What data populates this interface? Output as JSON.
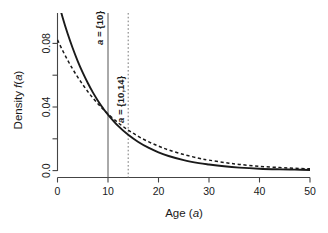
{
  "chart_data": {
    "type": "line",
    "title": "",
    "subtitle": "",
    "xlabel": "Age (a)",
    "xlabel_plain": "Age",
    "xlabel_variable": "a",
    "ylabel": "Density f(a)",
    "ylabel_plain": "Density",
    "ylabel_function": "f",
    "ylabel_variable": "a",
    "xlim": [
      0,
      50
    ],
    "ylim": [
      0,
      0.095
    ],
    "grid": false,
    "legend": "none",
    "xticks": [
      0,
      10,
      20,
      30,
      40,
      50
    ],
    "xtick_labels": [
      "0",
      "10",
      "20",
      "30",
      "40",
      "50"
    ],
    "yticks": [
      0.0,
      0.02,
      0.04,
      0.06,
      0.08
    ],
    "ytick_labels": [
      "0.0",
      "",
      "0.04",
      "",
      "0.08"
    ],
    "ytick_labels_shown": [
      "0.0",
      "0.04",
      "0.08"
    ],
    "series": [
      {
        "name": "a = {10}",
        "style": "solid",
        "color": "#1a1a1a",
        "x": [
          0,
          1,
          2,
          3,
          4,
          5,
          6,
          7,
          8,
          9,
          10,
          12,
          14,
          16,
          18,
          20,
          22,
          25,
          28,
          30,
          33,
          36,
          40,
          44,
          47,
          50
        ],
        "values": [
          0.108,
          0.0965,
          0.0862,
          0.0771,
          0.0689,
          0.0616,
          0.0551,
          0.0492,
          0.044,
          0.0393,
          0.0352,
          0.0281,
          0.0225,
          0.018,
          0.0144,
          0.0115,
          0.0092,
          0.0066,
          0.0047,
          0.0038,
          0.0027,
          0.0019,
          0.0012,
          0.0008,
          0.0006,
          0.0004
        ]
      },
      {
        "name": "a = {10,14}",
        "style": "dashed",
        "color": "#1a1a1a",
        "x": [
          0,
          1,
          2,
          3,
          4,
          5,
          6,
          7,
          8,
          9,
          10,
          12,
          14,
          16,
          18,
          20,
          22,
          25,
          28,
          30,
          33,
          36,
          40,
          44,
          47,
          50
        ],
        "values": [
          0.0822,
          0.0756,
          0.0695,
          0.0639,
          0.0588,
          0.0541,
          0.0497,
          0.0457,
          0.042,
          0.0387,
          0.0356,
          0.0301,
          0.0255,
          0.0215,
          0.0182,
          0.0154,
          0.013,
          0.0101,
          0.0078,
          0.0066,
          0.0051,
          0.0039,
          0.0027,
          0.0019,
          0.0015,
          0.0011
        ]
      }
    ],
    "annotations": [
      {
        "id": "vline-solid",
        "label": "a = {10}",
        "label_variable": "a",
        "label_rest": " = {10}",
        "x": 10,
        "line_style": "solid",
        "color": "#555555",
        "orientation": "vertical",
        "text_rotation": -90
      },
      {
        "id": "vline-dashed",
        "label": "a = {10,14}",
        "label_variable": "a",
        "label_rest": " = {10,14}",
        "x": 14,
        "line_style": "dotted",
        "color": "#777777",
        "orientation": "vertical",
        "text_rotation": -90
      }
    ]
  },
  "figure": {
    "background_color": "#ffffff",
    "axis_color": "#444444",
    "curve_color": "#1a1a1a"
  }
}
